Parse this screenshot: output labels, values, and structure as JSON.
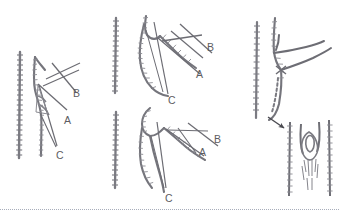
{
  "figure": {
    "background_color": "#ffffff",
    "ink_color": "#6a6a70",
    "label_color": "#5d5d62",
    "width": 339,
    "height": 223,
    "separator": {
      "name": "bottom-dotted-rule",
      "y": 209,
      "style": "dotted",
      "color": "#9aa0b0"
    }
  },
  "panels": [
    {
      "id": "panel-left",
      "position": "left",
      "description": "Bone tracing with scale bar and three angle reference lines",
      "labels": [
        {
          "text": "B",
          "x": 73,
          "y": 88
        },
        {
          "text": "A",
          "x": 64,
          "y": 115
        },
        {
          "text": "C",
          "x": 56,
          "y": 150
        }
      ]
    },
    {
      "id": "panel-middle-top",
      "position": "middle-top",
      "description": "Bone tracing with scale bar and three angle reference lines",
      "labels": [
        {
          "text": "B",
          "x": 207,
          "y": 42
        },
        {
          "text": "A",
          "x": 196,
          "y": 69
        },
        {
          "text": "C",
          "x": 168,
          "y": 95
        }
      ]
    },
    {
      "id": "panel-middle-bottom",
      "position": "middle-bottom",
      "description": "Bone tracing with scale bar and three angle reference lines",
      "labels": [
        {
          "text": "B",
          "x": 214,
          "y": 134
        },
        {
          "text": "A",
          "x": 199,
          "y": 147
        },
        {
          "text": "C",
          "x": 165,
          "y": 193
        }
      ]
    },
    {
      "id": "panel-right",
      "position": "right",
      "description": "Vessel tracing with branch, dashed continuation, arrow pointing to magnified inset of tubular structure",
      "labels": []
    }
  ],
  "annotations": {
    "arrow": {
      "name": "magnification-arrow",
      "from_x": 269,
      "from_y": 118,
      "to_x": 285,
      "to_y": 128
    }
  },
  "legend_letters": [
    "A",
    "B",
    "C"
  ]
}
